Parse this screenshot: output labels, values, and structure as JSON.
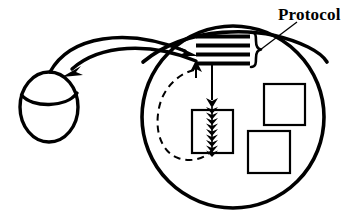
{
  "diagram": {
    "type": "schematic-illustration",
    "background_color": "#ffffff",
    "stroke_color": "#000000",
    "labels": {
      "protocol": "Protocol"
    },
    "shapes": {
      "small_ellipse": {
        "name": "small-ellipse-body",
        "cx": 49,
        "cy": 107,
        "rx": 29,
        "ry": 35,
        "stroke_width": 3.2,
        "fill": "none",
        "cap_arc_note": "lid arc across upper portion"
      },
      "large_circle": {
        "name": "large-circle-body",
        "cx": 233,
        "cy": 117,
        "r": 92,
        "stroke_width": 3.4,
        "fill": "none"
      },
      "segment_chord": {
        "name": "upper-segment-chord",
        "stroke_width": 3.4,
        "note": "curved chord separating upper lens region holding protocol bars"
      },
      "protocol_bars": {
        "name": "protocol-bar-stack",
        "count": 4,
        "x": 196,
        "width": 53,
        "y_positions": [
          36,
          45,
          54,
          63
        ],
        "thickness": 4,
        "fill": "#000000"
      },
      "brace": {
        "name": "right-curly-brace",
        "glyph": "}",
        "x": 252,
        "y": 50,
        "stroke_width": 2.4
      },
      "center_rectangle": {
        "name": "center-process-rectangle",
        "x": 192,
        "y": 110,
        "width": 40,
        "height": 43,
        "stroke_width": 2,
        "fill": "none"
      },
      "arrowhead_chain": {
        "name": "stacked-arrowhead-chain",
        "count": 10,
        "x": 212,
        "y_start": 104,
        "spacing": 5.5,
        "fill": "#000000"
      },
      "square_top_right": {
        "name": "square-upper-right",
        "x": 264,
        "y": 84,
        "size": 40,
        "stroke_width": 2,
        "fill": "none"
      },
      "square_bottom_right": {
        "name": "square-lower-right",
        "x": 248,
        "y": 131,
        "size": 41,
        "stroke_width": 2,
        "fill": "none"
      },
      "dashed_loop": {
        "name": "dashed-feedback-loop",
        "stroke_width": 2,
        "dash_pattern": "7 5",
        "fill": "none",
        "note": "loops from bottom of center rectangle back up to protocol bars"
      }
    },
    "connectors": [
      {
        "name": "arrow-request-outbound",
        "from": "small-ellipse",
        "to": "protocol-bar-stack",
        "direction": "left-to-right",
        "stroke_width": 3.2,
        "style": "solid-curved"
      },
      {
        "name": "arrow-response-inbound",
        "from": "protocol-bar-stack",
        "to": "small-ellipse",
        "direction": "right-to-left",
        "stroke_width": 3.2,
        "style": "solid-curved"
      },
      {
        "name": "arrow-bars-to-rectangle",
        "from": "protocol-bar-stack",
        "to": "center-process-rectangle",
        "direction": "downward",
        "stroke_width": 2,
        "style": "solid-vertical"
      },
      {
        "name": "arrow-upward-into-bars",
        "from": "dashed-feedback-loop",
        "to": "protocol-bar-stack",
        "direction": "upward",
        "stroke_width": 2,
        "style": "solid-short"
      },
      {
        "name": "leader-line-protocol-label",
        "from": "protocol-label",
        "to": "right-curly-brace",
        "stroke_width": 1.3,
        "style": "thin-diagonal"
      }
    ]
  }
}
